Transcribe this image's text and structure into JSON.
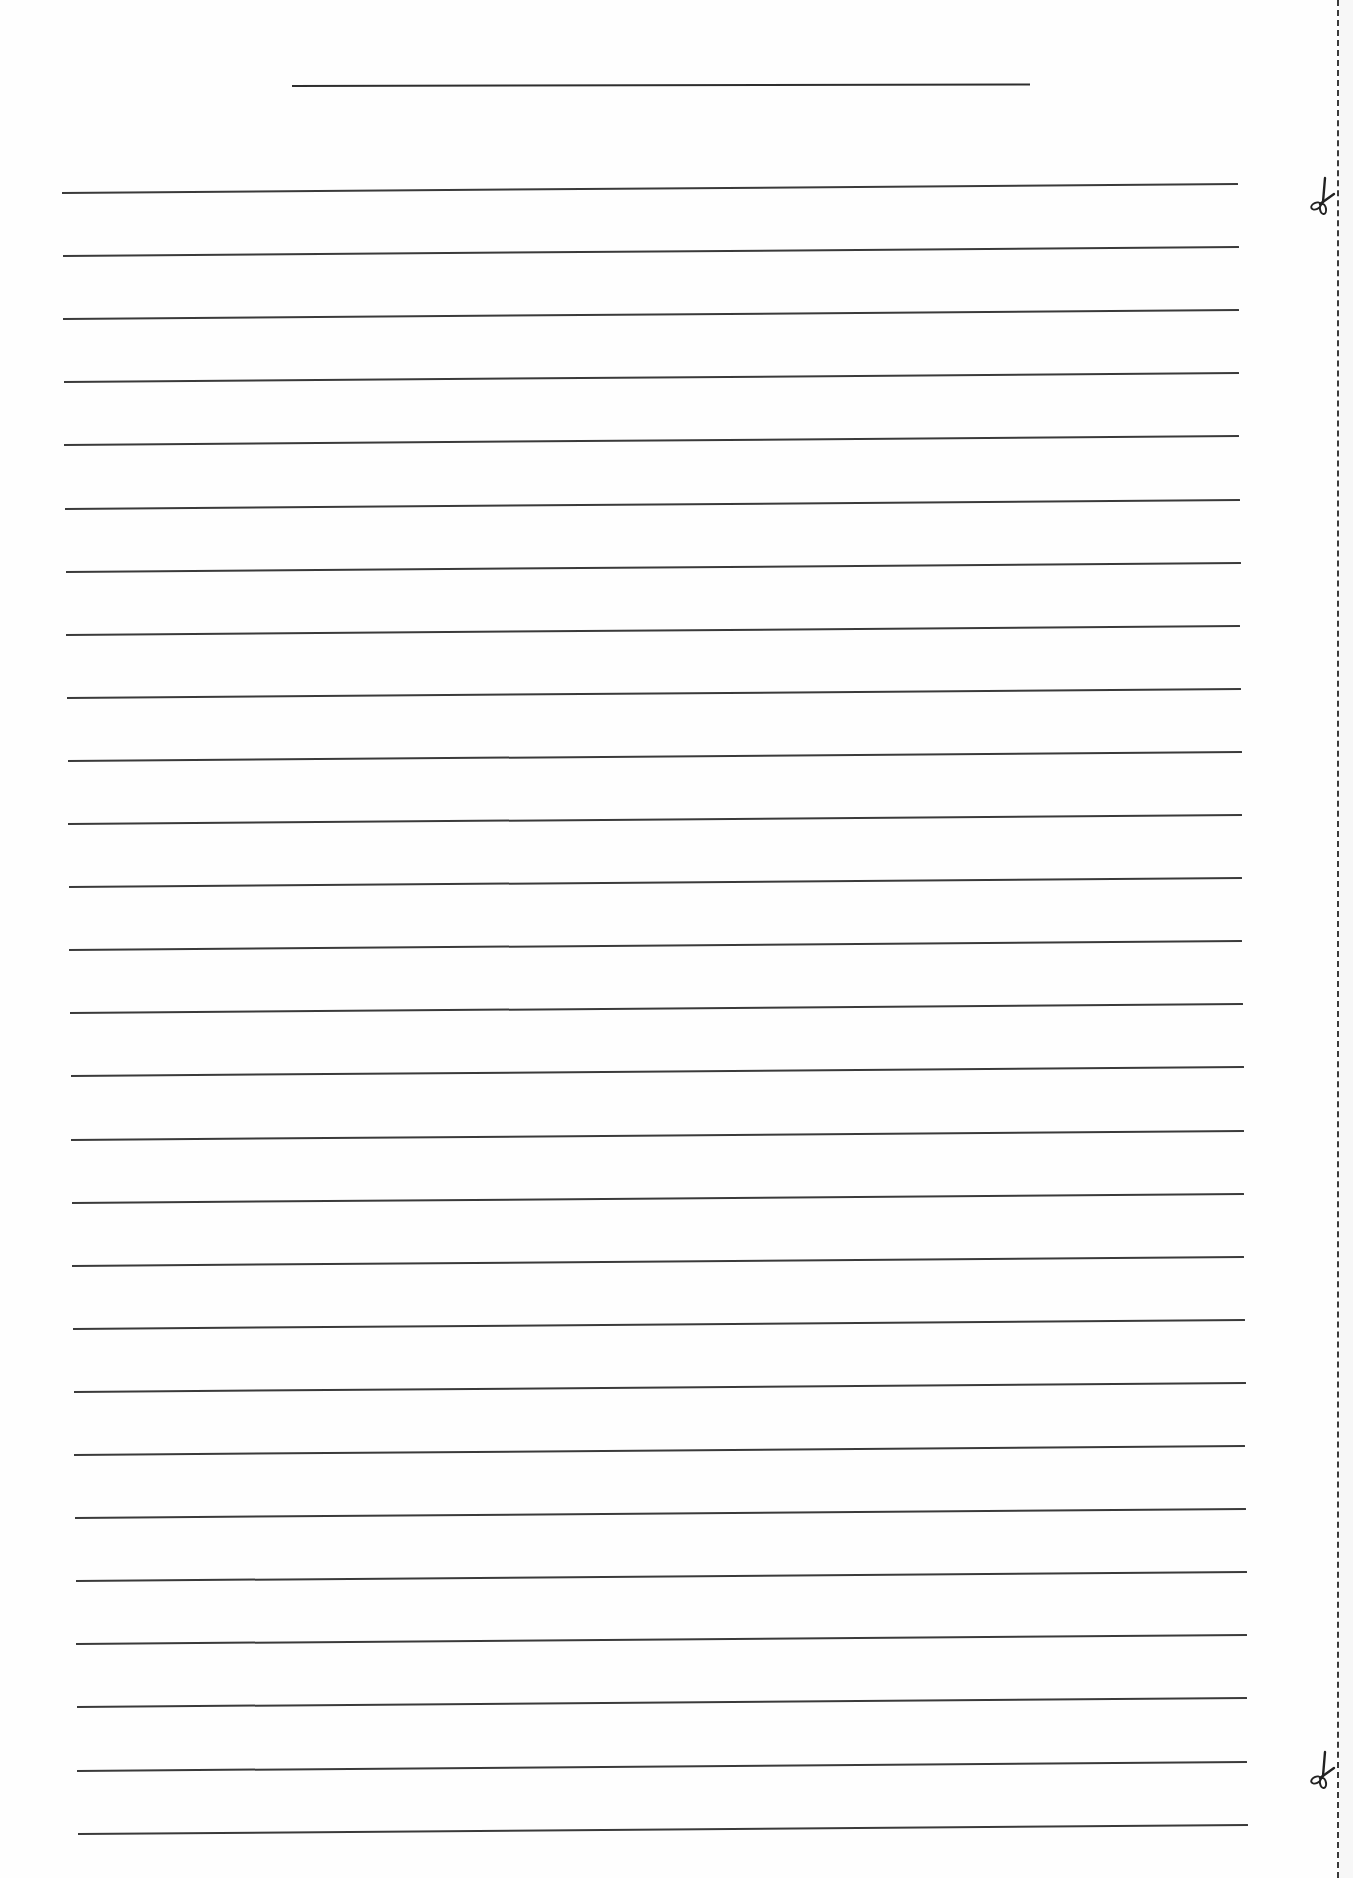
{
  "document": {
    "type": "lined-writing-paper",
    "title_line": {
      "x1": 292,
      "x2": 1030,
      "y": 85,
      "label": ""
    },
    "ruled_lines": {
      "count": 27,
      "first_y_left": 193,
      "first_y_right": 184,
      "spacing": 63.1,
      "left_start_x": 62,
      "left_end_x": 78,
      "right_start_x": 1238,
      "right_end_x": 1248,
      "color": "#3a3a3a"
    },
    "cut_line": {
      "x": 1337,
      "style": "dashed",
      "color": "#3a3a3a"
    },
    "scissors": [
      {
        "name": "scissors-top",
        "x": 1308,
        "y": 176,
        "icon": "scissors-icon"
      },
      {
        "name": "scissors-bottom",
        "x": 1308,
        "y": 1750,
        "icon": "scissors-icon"
      }
    ]
  }
}
